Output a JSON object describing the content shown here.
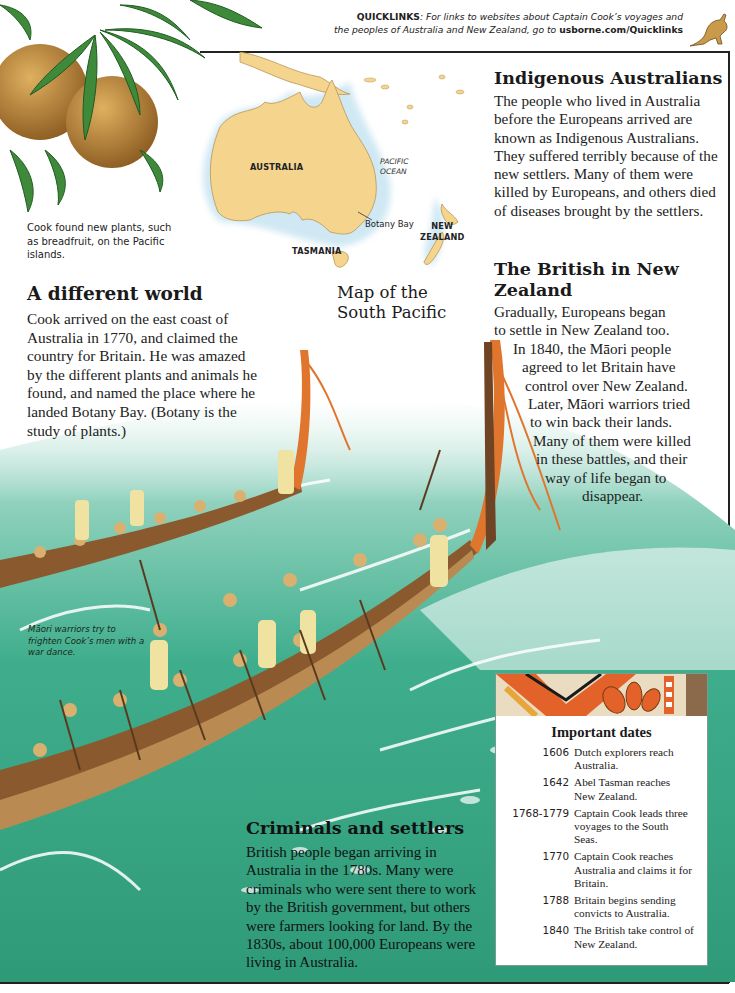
{
  "quicklinks": {
    "label": "QUICKLINKS",
    "text_line1": ": For links to websites about Captain Cook’s voyages and",
    "text_line2": "the peoples of Australia and New Zealand, go to ",
    "url": "usborne.com/Quicklinks",
    "icon": "kangaroo-icon"
  },
  "breadfruit": {
    "caption": "Cook found new plants, such as breadfruit, on the Pacific islands."
  },
  "map": {
    "title_line1": "Map of the",
    "title_line2": "South Pacific",
    "labels": {
      "australia": "AUSTRALIA",
      "pacific_line1": "PACIFIC",
      "pacific_line2": "OCEAN",
      "botany_bay": "Botany Bay",
      "new_zealand_line1": "NEW",
      "new_zealand_line2": "ZEALAND",
      "tasmania": "TASMANIA"
    },
    "colors": {
      "land": "#f5d58e",
      "sea_glow": "#cfe8f3",
      "coast": "#b8945a"
    }
  },
  "sections": {
    "different_world": {
      "heading": "A different world",
      "body": "Cook arrived on the east coast of Australia in 1770, and claimed the country for Britain. He was amazed by the different plants and animals he found, and named the place where he landed Botany Bay. (Botany is the study of plants.)"
    },
    "indigenous": {
      "heading": "Indigenous Australians",
      "body": "The people who lived in Australia before the Europeans arrived are known as Indigenous Australians. They suffered terribly because of the new settlers. Many of them were killed by Europeans, and others died of diseases brought by the settlers."
    },
    "british_nz": {
      "heading": "The British in New Zealand",
      "lines": [
        "Gradually, Europeans began",
        "to settle in New Zealand too.",
        "In 1840, the Māori people",
        "agreed to let Britain have",
        "control over New Zealand.",
        "Later, Māori warriors tried",
        "to win back their lands.",
        "Many of them were killed",
        "in these battles, and their",
        "way of life began to",
        "disappear."
      ]
    },
    "criminals": {
      "heading": "Criminals and settlers",
      "body": "British people began arriving in Australia in the 1780s. Many were criminals who were sent there to work by the British government, but others were farmers looking for land. By the 1830s, about 100,000 Europeans were living in Australia."
    }
  },
  "illustration": {
    "caption": "Māori warriors try to frighten Cook’s men with a war dance.",
    "colors": {
      "sea": "#3fae8c",
      "sea_dark": "#2a8f72",
      "foam": "#ffffff",
      "canoe": "#9a6a3a",
      "prow": "#e0762e"
    }
  },
  "important_dates": {
    "title": "Important dates",
    "entries": [
      {
        "year": "1606",
        "text": "Dutch explorers reach Australia."
      },
      {
        "year": "1642",
        "text": "Abel Tasman reaches New Zealand."
      },
      {
        "year": "1768-1779",
        "text": "Captain Cook leads three voyages to the South Seas."
      },
      {
        "year": "1770",
        "text": "Captain Cook reaches Australia and claims it for Britain."
      },
      {
        "year": "1788",
        "text": "Britain begins sending convicts to Australia."
      },
      {
        "year": "1840",
        "text": "The British take control of New Zealand."
      }
    ]
  }
}
